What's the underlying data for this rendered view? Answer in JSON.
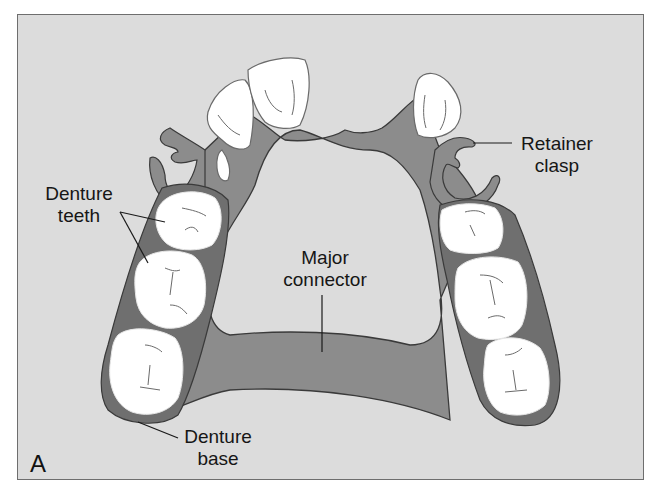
{
  "figure": {
    "panel_letter": "A",
    "labels": {
      "denture_teeth": [
        "Denture",
        "teeth"
      ],
      "major_connector": [
        "Major",
        "connector"
      ],
      "retainer_clasp": [
        "Retainer",
        "clasp"
      ],
      "denture_base": [
        "Denture",
        "base"
      ]
    },
    "colors": {
      "background": "#dcdcdc",
      "framework": "#8c8c8c",
      "denture_base": "#6f6f6f",
      "teeth": "#ffffff",
      "outline": "#3a3a3a",
      "text": "#161616"
    }
  }
}
